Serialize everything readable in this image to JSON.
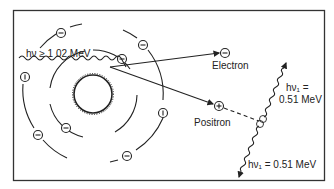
{
  "diagram": {
    "incident_photon": {
      "label": "hν ≥ 1 02 MeV"
    },
    "electron": {
      "label": "Electron",
      "symbol": "⊖"
    },
    "positron": {
      "label": "Positron",
      "symbol": "⊕"
    },
    "annihilation_photon_up": {
      "label_line1": "hν₁ =",
      "label_line2": "0.51 MeV"
    },
    "annihilation_photon_down": {
      "label": "hν₁ = 0.51 MeV"
    },
    "orbital_electrons": {
      "symbol": "−",
      "count": 10
    },
    "colors": {
      "line": "#222222",
      "background": "#ffffff",
      "frame": "#333333"
    }
  }
}
